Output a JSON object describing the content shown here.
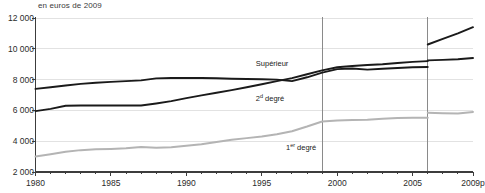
{
  "unit_note": "en euros de 2009",
  "axis": {
    "y_ticks": [
      "2 000",
      "4 000",
      "6 000",
      "8 000",
      "10 000",
      "12 000"
    ],
    "x_ticks": [
      "1980",
      "1985",
      "1990",
      "1995",
      "2000",
      "2005",
      "2009p"
    ]
  },
  "labels": {
    "superieur": "Supérieur",
    "second_degre_pre": "2",
    "second_degre_sup": "d",
    "second_degre_post": " degré",
    "premier_degre_pre": "1",
    "premier_degre_sup": "er",
    "premier_degre_post": " degré"
  },
  "colors": {
    "dark_line": "#1a1a1a",
    "grey_line": "#b4b4b4",
    "gridline": "#e2e2e2",
    "axis": "#3c3c3c",
    "break_line": "#8a8a8a",
    "background": "#ffffff"
  },
  "chart_data": {
    "type": "line",
    "title": "",
    "subtitle": "en euros de 2009",
    "xlabel": "",
    "ylabel": "",
    "xlim": [
      1980,
      2009
    ],
    "ylim": [
      2000,
      12000
    ],
    "grid": true,
    "legend_position": "inline-annotations",
    "x": [
      1980,
      1981,
      1982,
      1983,
      1984,
      1985,
      1986,
      1987,
      1988,
      1989,
      1990,
      1991,
      1992,
      1993,
      1994,
      1995,
      1996,
      1997,
      1998,
      1999,
      2000,
      2001,
      2002,
      2003,
      2004,
      2005,
      2006,
      2007,
      2008,
      2009
    ],
    "breaks": [
      {
        "year": 1999,
        "note": "vertical reference line"
      },
      {
        "year": 2006,
        "note": "series discontinuity — vertical reference line"
      }
    ],
    "series": [
      {
        "name": "Supérieur",
        "color": "#1a1a1a",
        "values": [
          7400,
          7500,
          7620,
          7720,
          7800,
          7850,
          7900,
          7950,
          8080,
          8100,
          8100,
          8100,
          8090,
          8060,
          8040,
          8020,
          8000,
          7900,
          8150,
          8450,
          8680,
          8720,
          8650,
          8700,
          8750,
          8800,
          8820,
          null,
          null,
          null
        ],
        "values_after_break": {
          "x": [
            2006,
            2007,
            2008,
            2009
          ],
          "values": [
            10280,
            10650,
            11000,
            11400
          ]
        }
      },
      {
        "name": "2d degré",
        "color": "#1a1a1a",
        "values": [
          5950,
          6100,
          6300,
          6320,
          6320,
          6320,
          6320,
          6320,
          6450,
          6600,
          6800,
          6980,
          7150,
          7320,
          7500,
          7700,
          7900,
          8100,
          8350,
          8600,
          8800,
          8880,
          8950,
          9000,
          9080,
          9150,
          9200,
          null,
          null,
          null
        ],
        "values_after_break": {
          "x": [
            2006,
            2007,
            2008,
            2009
          ],
          "values": [
            9250,
            9280,
            9320,
            9400
          ]
        }
      },
      {
        "name": "1er degré",
        "color": "#b4b4b4",
        "values": [
          3000,
          3150,
          3320,
          3420,
          3470,
          3500,
          3540,
          3620,
          3580,
          3600,
          3700,
          3800,
          3950,
          4100,
          4200,
          4300,
          4450,
          4650,
          4950,
          5280,
          5350,
          5380,
          5400,
          5450,
          5500,
          5520,
          5530,
          null,
          null,
          null
        ],
        "values_after_break": {
          "x": [
            2006,
            2007,
            2008,
            2009
          ],
          "values": [
            5850,
            5820,
            5800,
            5900
          ]
        }
      }
    ]
  }
}
